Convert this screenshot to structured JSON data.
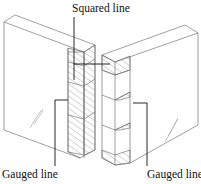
{
  "figure": {
    "labels": {
      "squared_line": "Squared line",
      "gauged_line_left": "Gauged line",
      "gauged_line_right": "Gauged line"
    },
    "colors": {
      "outline": "#777777",
      "hatch": "#888888",
      "leader": "#111111",
      "text": "#111111",
      "background": "#ffffff"
    }
  }
}
